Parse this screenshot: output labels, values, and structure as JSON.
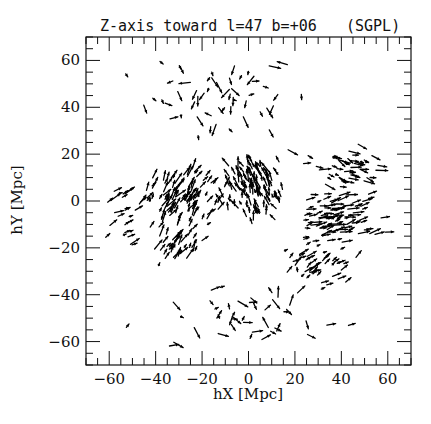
{
  "chart_data": {
    "type": "quiver",
    "title": "Z-axis toward l=47 b=+06",
    "title_tag": "(SGPL)",
    "xlabel": "hX [Mpc]",
    "ylabel": "hY [Mpc]",
    "xlim": [
      -70,
      70
    ],
    "ylim": [
      -70,
      70
    ],
    "x_major_ticks": [
      -60,
      -40,
      -20,
      0,
      20,
      40,
      60
    ],
    "y_major_ticks": [
      -60,
      -40,
      -20,
      0,
      20,
      40,
      60
    ],
    "x_tick_labels": [
      "-60",
      "-40",
      "-20",
      "0",
      "20",
      "40",
      "60"
    ],
    "y_tick_labels": [
      "-60",
      "-40",
      "-20",
      "0",
      "20",
      "40",
      "60"
    ],
    "minor_tick_step": 5,
    "grid": false,
    "legend": null,
    "clusters": [
      {
        "name": "central",
        "cx": 2,
        "cy": 5,
        "spread_x": 10,
        "spread_y": 10,
        "count": 120,
        "flow_dx": -1,
        "flow_dy": 3
      },
      {
        "name": "left-mid",
        "cx": -28,
        "cy": 0,
        "spread_x": 14,
        "spread_y": 10,
        "count": 110,
        "flow_dx": 2,
        "flow_dy": 3
      },
      {
        "name": "left-low",
        "cx": -32,
        "cy": -20,
        "spread_x": 10,
        "spread_y": 6,
        "count": 40,
        "flow_dx": 2,
        "flow_dy": 3
      },
      {
        "name": "right-band",
        "cx": 38,
        "cy": -8,
        "spread_x": 14,
        "spread_y": 8,
        "count": 100,
        "flow_dx": 4,
        "flow_dy": 1
      },
      {
        "name": "right-low",
        "cx": 30,
        "cy": -28,
        "spread_x": 12,
        "spread_y": 8,
        "count": 45,
        "flow_dx": 3,
        "flow_dy": 2
      },
      {
        "name": "right-upper",
        "cx": 40,
        "cy": 15,
        "spread_x": 14,
        "spread_y": 6,
        "count": 50,
        "flow_dx": 3,
        "flow_dy": -1
      },
      {
        "name": "left-far",
        "cx": -55,
        "cy": -5,
        "spread_x": 8,
        "spread_y": 12,
        "count": 25,
        "flow_dx": 4,
        "flow_dy": 2
      },
      {
        "name": "upper-scatter",
        "cx": -10,
        "cy": 45,
        "spread_x": 30,
        "spread_y": 15,
        "count": 55,
        "flow_dx": 0,
        "flow_dy": -1
      },
      {
        "name": "lower-scatter",
        "cx": 0,
        "cy": -50,
        "spread_x": 35,
        "spread_y": 12,
        "count": 45,
        "flow_dx": 1,
        "flow_dy": 0
      }
    ]
  }
}
